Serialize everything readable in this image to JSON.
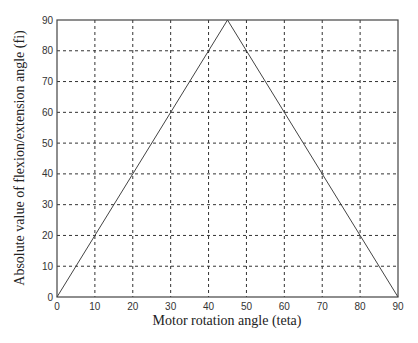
{
  "chart_data": {
    "type": "line",
    "title": "",
    "xlabel": "Motor rotation angle (teta)",
    "ylabel": "Absolute value of flexion/extension angle (fi)",
    "xlim": [
      0,
      90
    ],
    "ylim": [
      0,
      90
    ],
    "xticks": [
      0,
      10,
      20,
      30,
      40,
      50,
      60,
      70,
      80,
      90
    ],
    "yticks": [
      0,
      10,
      20,
      30,
      40,
      50,
      60,
      70,
      80,
      90
    ],
    "grid": true,
    "grid_style": "dashed",
    "legend": null,
    "series": [
      {
        "name": "fi vs teta",
        "x": [
          0,
          45,
          90
        ],
        "y": [
          0,
          90,
          0
        ],
        "color": "#444444"
      }
    ]
  },
  "plot": {
    "left": 57,
    "top": 20,
    "right": 398,
    "bottom": 297
  }
}
